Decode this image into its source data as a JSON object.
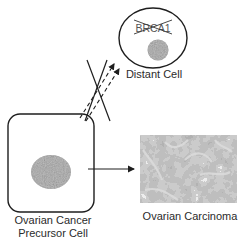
{
  "diagram": {
    "distant_cell": {
      "label": "Distant Cell",
      "gene_label": "BRCA1",
      "gene_struck_through": true
    },
    "precursor_cell": {
      "label_line1": "Ovarian Cancer",
      "label_line2": "Precursor Cell"
    },
    "carcinoma": {
      "label": "Ovarian Carcinoma"
    },
    "connections": [
      {
        "from": "precursor_cell",
        "to": "distant_cell",
        "style": "dashed-double-arrow",
        "blocked": true
      },
      {
        "from": "precursor_cell",
        "to": "carcinoma",
        "style": "solid-arrow",
        "blocked": false
      }
    ],
    "colors": {
      "line": "#1e1e1e",
      "nucleus": "#9a9a9a",
      "tissue_dark": "#6e6e6e",
      "tissue_light": "#d8d8d8"
    }
  }
}
